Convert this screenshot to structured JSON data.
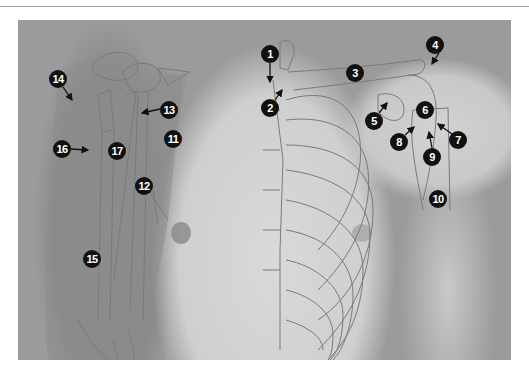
{
  "figure": {
    "type": "anatomical-photo",
    "colors": {
      "background": "#9b9b9b",
      "skin_light": "#d6d6d6",
      "muscle_overlay": "#8d8d8d",
      "outline": "#7a7a7a",
      "marker_fill": "#111111",
      "marker_text": "#ffffff"
    },
    "labels": [
      {
        "n": "1",
        "x": 252,
        "y": 34
      },
      {
        "n": "2",
        "x": 252,
        "y": 88
      },
      {
        "n": "3",
        "x": 337,
        "y": 53
      },
      {
        "n": "4",
        "x": 417,
        "y": 25
      },
      {
        "n": "5",
        "x": 356,
        "y": 101
      },
      {
        "n": "6",
        "x": 407,
        "y": 90
      },
      {
        "n": "7",
        "x": 440,
        "y": 120
      },
      {
        "n": "8",
        "x": 381,
        "y": 122
      },
      {
        "n": "9",
        "x": 414,
        "y": 137
      },
      {
        "n": "10",
        "x": 420,
        "y": 179
      },
      {
        "n": "11",
        "x": 155,
        "y": 119
      },
      {
        "n": "12",
        "x": 126,
        "y": 166
      },
      {
        "n": "13",
        "x": 151,
        "y": 90
      },
      {
        "n": "14",
        "x": 40,
        "y": 59
      },
      {
        "n": "15",
        "x": 74,
        "y": 239
      },
      {
        "n": "16",
        "x": 44,
        "y": 129
      },
      {
        "n": "17",
        "x": 99,
        "y": 131
      }
    ]
  }
}
